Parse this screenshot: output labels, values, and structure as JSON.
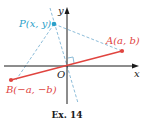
{
  "diagram": {
    "axes": {
      "x_label": "x",
      "y_label": "y",
      "origin_label": "O"
    },
    "points": {
      "P": {
        "label": "P(x, y)",
        "color": "#2a9fc9"
      },
      "A": {
        "label": "A(a, b)",
        "color": "#e0443f"
      },
      "B": {
        "label": "B(−a, −b)",
        "color": "#e0443f"
      }
    },
    "segment_color": "#e0443f",
    "dashed_color": "#7fb4d4",
    "axis_color": "#1a1a1a",
    "caption": "Ex. 14"
  }
}
